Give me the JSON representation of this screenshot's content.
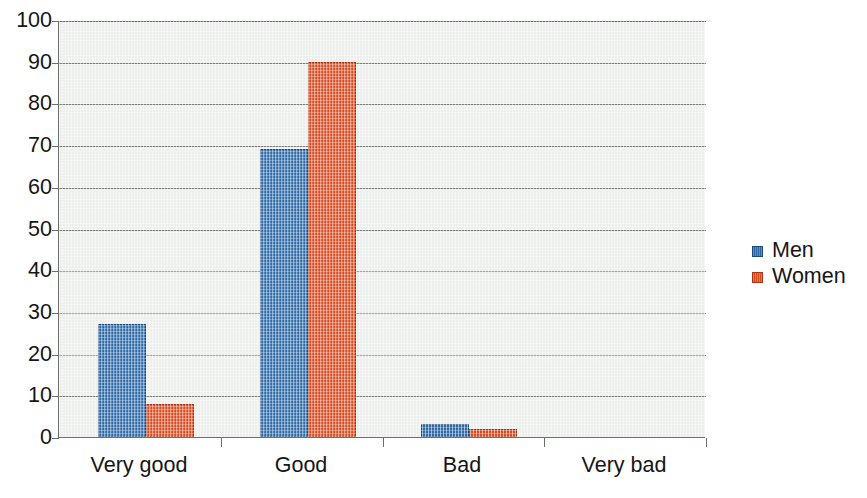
{
  "chart_data": {
    "type": "bar",
    "title": "",
    "subtitle": "",
    "xlabel": "",
    "ylabel": "",
    "categories": [
      "Very good",
      "Good",
      "Bad",
      "Very bad"
    ],
    "series": [
      {
        "name": "Men",
        "color": "#2f6ead",
        "values": [
          27,
          69,
          3,
          0
        ]
      },
      {
        "name": "Women",
        "color": "#e24f24",
        "values": [
          8,
          90,
          2,
          0
        ]
      }
    ],
    "ylim": [
      0,
      100
    ],
    "ytick_step": 10,
    "ytick_labels": [
      "100",
      "90",
      "80",
      "70",
      "60",
      "50",
      "40",
      "30",
      "20",
      "10",
      "0"
    ],
    "grid": "horizontal",
    "legend_position": "right",
    "annotations": []
  },
  "axes": {
    "y_ticks": [
      {
        "label": "100",
        "value": 100
      },
      {
        "label": "90",
        "value": 90
      },
      {
        "label": "80",
        "value": 80
      },
      {
        "label": "70",
        "value": 70
      },
      {
        "label": "60",
        "value": 60
      },
      {
        "label": "50",
        "value": 50
      },
      {
        "label": "40",
        "value": 40
      },
      {
        "label": "30",
        "value": 30
      },
      {
        "label": "20",
        "value": 20
      },
      {
        "label": "10",
        "value": 10
      },
      {
        "label": "0",
        "value": 0
      }
    ],
    "x_categories": [
      "Very good",
      "Good",
      "Bad",
      "Very bad"
    ]
  },
  "legend": {
    "entries": [
      {
        "label": "Men",
        "color": "#2f6ead"
      },
      {
        "label": "Women",
        "color": "#e24f24"
      }
    ]
  },
  "style": {
    "plot_background": "#eceeec",
    "gridline_color": "#7e827e",
    "axis_color": "#6b6f6b",
    "text_color": "#161616",
    "page_background": "#ffffff"
  }
}
